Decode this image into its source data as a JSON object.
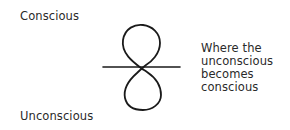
{
  "diagram": {
    "top_label": "Conscious",
    "bottom_label": "Unconscious",
    "annotation": {
      "lines": [
        "Where the",
        "unconscious",
        "becomes",
        "conscious"
      ]
    },
    "shapes": {
      "figure": "figure-eight loop crossing a horizontal line",
      "stroke_color": "#1a1a1a"
    }
  }
}
